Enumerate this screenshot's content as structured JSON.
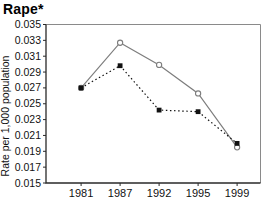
{
  "colors": {
    "background": "#ffffff",
    "text": "#111111",
    "axis": "#2a2a2a",
    "frame": "#8a8a8a",
    "series_circles": "#7d7d7d",
    "series_squares": "#111111",
    "marker_circle_fill": "#ffffff"
  },
  "chart_data": {
    "type": "line",
    "title": "Rape*",
    "xlabel": "",
    "ylabel": "Rate per 1,000 population",
    "categories": [
      "1981",
      "1987",
      "1992",
      "1995",
      "1999"
    ],
    "series": [
      {
        "name": "open-circle-solid",
        "marker": "circle",
        "line_style": "solid",
        "color": "#7d7d7d",
        "values": [
          0.027,
          0.0327,
          0.0299,
          0.0263,
          0.0195
        ]
      },
      {
        "name": "filled-square-dotted",
        "marker": "square",
        "line_style": "dotted",
        "color": "#111111",
        "values": [
          0.027,
          0.0298,
          0.0242,
          0.024,
          0.02
        ]
      }
    ],
    "ylim": [
      0.015,
      0.035
    ],
    "yticks": [
      0.015,
      0.017,
      0.019,
      0.021,
      0.023,
      0.025,
      0.027,
      0.029,
      0.031,
      0.033,
      0.035
    ],
    "ytick_decimals": 3,
    "grid": false,
    "legend": "none"
  }
}
